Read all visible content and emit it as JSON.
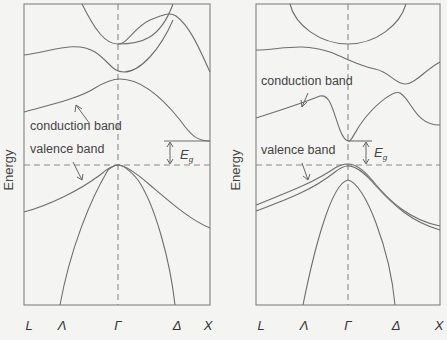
{
  "figure": {
    "type": "band-structure-comparison",
    "panels": [
      {
        "id": "left",
        "description": "Indirect band gap semiconductor",
        "y_axis_label": "Energy",
        "annotations": {
          "conduction_band": "conduction band",
          "valence_band": "valence band",
          "gap_symbol": "E",
          "gap_subscript": "g"
        },
        "k_points": [
          "L",
          "Λ",
          "Γ",
          "Δ",
          "X"
        ]
      },
      {
        "id": "right",
        "description": "Direct band gap semiconductor",
        "y_axis_label": "Energy",
        "annotations": {
          "conduction_band": "conduction band",
          "valence_band": "valence band",
          "gap_symbol": "E",
          "gap_subscript": "g"
        },
        "k_points": [
          "L",
          "Λ",
          "Γ",
          "Δ",
          "X"
        ]
      }
    ],
    "colors": {
      "background": "#f4f4f2",
      "lines": "#6e6e6e",
      "text": "#444444"
    }
  }
}
